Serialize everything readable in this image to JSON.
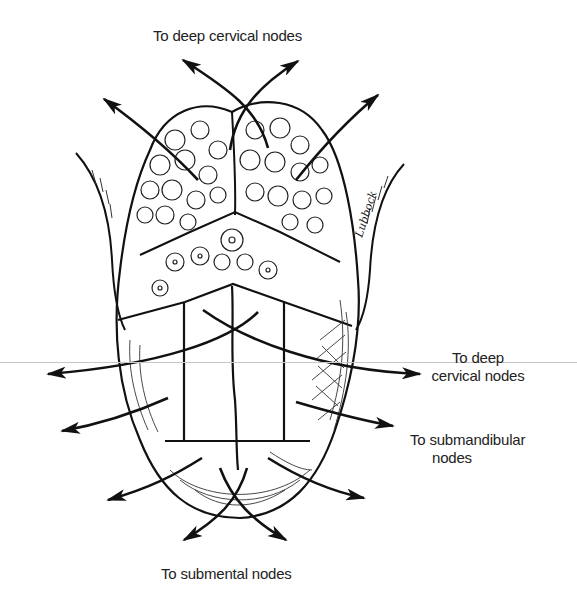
{
  "figure": {
    "labels": {
      "top": "To deep cervical nodes",
      "right_upper_line1": "To deep",
      "right_upper_line2": "cervical nodes",
      "right_lower_line1": "To submandibular",
      "right_lower_line2": "nodes",
      "bottom": "To submental nodes"
    },
    "signature": "Lubbock",
    "arrows": [
      {
        "id": "top-left-crossing",
        "target": "To deep cervical nodes"
      },
      {
        "id": "top-right-crossing",
        "target": "To deep cervical nodes"
      },
      {
        "id": "top-far-left",
        "target": "To deep cervical nodes"
      },
      {
        "id": "top-far-right",
        "target": "To deep cervical nodes"
      },
      {
        "id": "mid-left",
        "target": "To deep cervical nodes"
      },
      {
        "id": "mid-right",
        "target": "To deep cervical nodes"
      },
      {
        "id": "lower-left",
        "target": "To submandibular nodes"
      },
      {
        "id": "lower-right",
        "target": "To submandibular nodes"
      },
      {
        "id": "tip-left-outer",
        "target": "To submandibular nodes"
      },
      {
        "id": "tip-right-outer",
        "target": "To submandibular nodes"
      },
      {
        "id": "tip-crossing-left",
        "target": "To submental nodes"
      },
      {
        "id": "tip-crossing-right",
        "target": "To submental nodes"
      }
    ],
    "colors": {
      "ink": "#111111",
      "text": "#222222",
      "background": "#ffffff"
    }
  }
}
